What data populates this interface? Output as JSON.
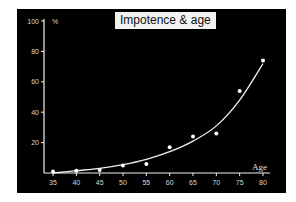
{
  "chart_data": {
    "type": "scatter",
    "title": "Impotence & age",
    "xlabel": "Age",
    "ylabel": "%",
    "x_ticks": [
      35,
      40,
      45,
      50,
      55,
      60,
      65,
      70,
      75,
      80
    ],
    "y_ticks": [
      20,
      40,
      60,
      80,
      100
    ],
    "xlim": [
      35,
      80
    ],
    "ylim": [
      0,
      100
    ],
    "grid": false,
    "legend": "none",
    "series": [
      {
        "name": "Observed",
        "x": [
          35,
          40,
          45,
          50,
          55,
          60,
          65,
          70,
          75,
          80
        ],
        "y": [
          1,
          1.5,
          2,
          5,
          6,
          17,
          24,
          26,
          54,
          74
        ]
      },
      {
        "name": "Fitted curve",
        "type": "line",
        "x": [
          35,
          40,
          45,
          50,
          55,
          60,
          65,
          70,
          75,
          80
        ],
        "y": [
          0,
          1.5,
          3,
          5.5,
          9,
          14,
          21,
          31,
          48,
          72
        ]
      }
    ],
    "colors": {
      "background": "#000000",
      "foreground": "#f0f0f0",
      "title_box": "#f2f2f2"
    }
  }
}
